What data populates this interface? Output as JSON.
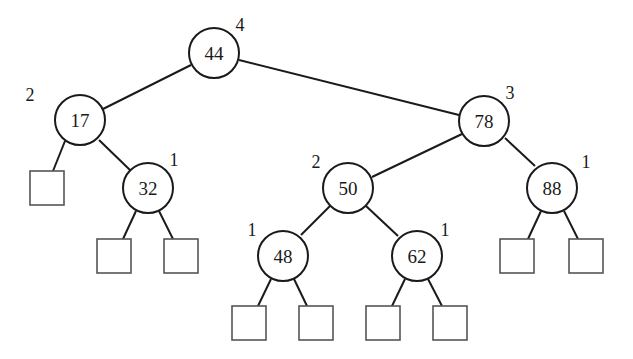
{
  "diagram": {
    "type": "AVL tree",
    "colors": {
      "stroke": "#1a1a1a",
      "leaf_stroke": "#555555",
      "background": "#ffffff"
    },
    "node_radius": 25,
    "leaf_size": 34,
    "nodes": [
      {
        "id": "n44",
        "key": "44",
        "height": "4",
        "cx": 214,
        "cy": 53,
        "hx": 240,
        "hy": 31
      },
      {
        "id": "n17",
        "key": "17",
        "height": "2",
        "cx": 80,
        "cy": 120,
        "hx": 30,
        "hy": 101
      },
      {
        "id": "n32",
        "key": "32",
        "height": "1",
        "cx": 148,
        "cy": 188,
        "hx": 174,
        "hy": 166
      },
      {
        "id": "n78",
        "key": "78",
        "height": "3",
        "cx": 484,
        "cy": 121,
        "hx": 510,
        "hy": 99
      },
      {
        "id": "n50",
        "key": "50",
        "height": "2",
        "cx": 348,
        "cy": 188,
        "hx": 316,
        "hy": 168
      },
      {
        "id": "n88",
        "key": "88",
        "height": "1",
        "cx": 552,
        "cy": 188,
        "hx": 586,
        "hy": 168
      },
      {
        "id": "n48",
        "key": "48",
        "height": "1",
        "cx": 283,
        "cy": 256,
        "hx": 252,
        "hy": 236
      },
      {
        "id": "n62",
        "key": "62",
        "height": "1",
        "cx": 417,
        "cy": 256,
        "hx": 445,
        "hy": 236
      }
    ],
    "leaves": [
      {
        "id": "l17L",
        "x": 30,
        "y": 171
      },
      {
        "id": "l32L",
        "x": 97,
        "y": 239
      },
      {
        "id": "l32R",
        "x": 164,
        "y": 239
      },
      {
        "id": "l48L",
        "x": 232,
        "y": 306
      },
      {
        "id": "l48R",
        "x": 299,
        "y": 306
      },
      {
        "id": "l62L",
        "x": 366,
        "y": 306
      },
      {
        "id": "l62R",
        "x": 433,
        "y": 306
      },
      {
        "id": "l88L",
        "x": 500,
        "y": 239
      },
      {
        "id": "l88R",
        "x": 569,
        "y": 239
      }
    ],
    "edges": [
      {
        "from": "n44",
        "to": "n17",
        "x1": 191,
        "y1": 65,
        "x2": 103,
        "y2": 109
      },
      {
        "from": "n44",
        "to": "n78",
        "x1": 239,
        "y1": 60,
        "x2": 459,
        "y2": 115
      },
      {
        "from": "n17",
        "to": "l17L",
        "x1": 65,
        "y1": 141,
        "x2": 53,
        "y2": 171
      },
      {
        "from": "n17",
        "to": "n32",
        "x1": 99,
        "y1": 140,
        "x2": 130,
        "y2": 170
      },
      {
        "from": "n32",
        "to": "l32L",
        "x1": 136,
        "y1": 211,
        "x2": 123,
        "y2": 239
      },
      {
        "from": "n32",
        "to": "l32R",
        "x1": 159,
        "y1": 211,
        "x2": 173,
        "y2": 239
      },
      {
        "from": "n78",
        "to": "n50",
        "x1": 462,
        "y1": 134,
        "x2": 372,
        "y2": 177
      },
      {
        "from": "n78",
        "to": "n88",
        "x1": 505,
        "y1": 138,
        "x2": 535,
        "y2": 166
      },
      {
        "from": "n50",
        "to": "n48",
        "x1": 330,
        "y1": 206,
        "x2": 301,
        "y2": 235
      },
      {
        "from": "n50",
        "to": "n62",
        "x1": 366,
        "y1": 206,
        "x2": 398,
        "y2": 236
      },
      {
        "from": "n48",
        "to": "l48L",
        "x1": 271,
        "y1": 279,
        "x2": 258,
        "y2": 306
      },
      {
        "from": "n48",
        "to": "l48R",
        "x1": 294,
        "y1": 279,
        "x2": 307,
        "y2": 306
      },
      {
        "from": "n62",
        "to": "l62L",
        "x1": 405,
        "y1": 279,
        "x2": 392,
        "y2": 306
      },
      {
        "from": "n62",
        "to": "l62R",
        "x1": 428,
        "y1": 279,
        "x2": 442,
        "y2": 306
      },
      {
        "from": "n88",
        "to": "l88L",
        "x1": 541,
        "y1": 211,
        "x2": 528,
        "y2": 239
      },
      {
        "from": "n88",
        "to": "l88R",
        "x1": 564,
        "y1": 211,
        "x2": 578,
        "y2": 239
      }
    ]
  }
}
